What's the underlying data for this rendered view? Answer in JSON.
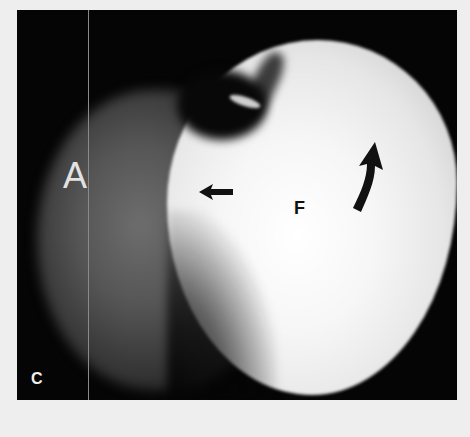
{
  "figure": {
    "panel_label": "C",
    "labels": {
      "left_structure": "A",
      "femoral_head": "F"
    },
    "annotations": [
      {
        "type": "straight-arrow",
        "direction": "left",
        "color": "#111111"
      },
      {
        "type": "curved-arrow",
        "direction": "up",
        "color": "#111111"
      }
    ],
    "colors": {
      "background": "#050505",
      "page": "#eeeeee",
      "bright_tissue": "#f6f6f6",
      "gray_tissue": "#555555"
    }
  }
}
